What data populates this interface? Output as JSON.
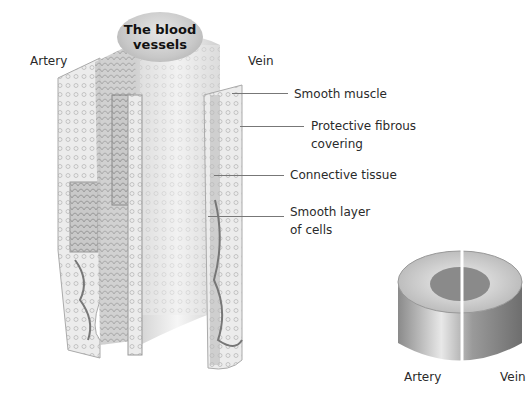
{
  "title": {
    "line1": "The blood",
    "line2": "vessels"
  },
  "main_figure": {
    "left_label": "Artery",
    "right_label": "Vein"
  },
  "callouts": [
    {
      "id": "smooth-muscle",
      "lines": [
        "Smooth muscle"
      ]
    },
    {
      "id": "protective-fibrous-covering",
      "lines": [
        "Protective fibrous",
        "covering"
      ]
    },
    {
      "id": "connective-tissue",
      "lines": [
        "Connective tissue"
      ]
    },
    {
      "id": "smooth-layer-of-cells",
      "lines": [
        "Smooth layer",
        "of cells"
      ]
    }
  ],
  "cross_section": {
    "left_label": "Artery",
    "right_label": "Vein"
  },
  "colors": {
    "background": "#ffffff",
    "text": "#2a2a2a",
    "badge": "#c8c8c8",
    "leader": "#777777"
  }
}
